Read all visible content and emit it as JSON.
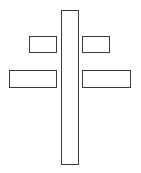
{
  "diagram": {
    "title": "",
    "shapes": [
      {
        "id": "stem",
        "kind": "rectangle",
        "role": "vertical-stem"
      },
      {
        "id": "arm-tl",
        "kind": "rectangle",
        "role": "upper-left-arm"
      },
      {
        "id": "arm-tr",
        "kind": "rectangle",
        "role": "upper-right-arm"
      },
      {
        "id": "arm-bl",
        "kind": "rectangle",
        "role": "lower-left-arm"
      },
      {
        "id": "arm-br",
        "kind": "rectangle",
        "role": "lower-right-arm"
      }
    ],
    "colors": {
      "stroke": "#3a3a3a",
      "fill": "#ffffff",
      "background": "#ffffff"
    }
  }
}
